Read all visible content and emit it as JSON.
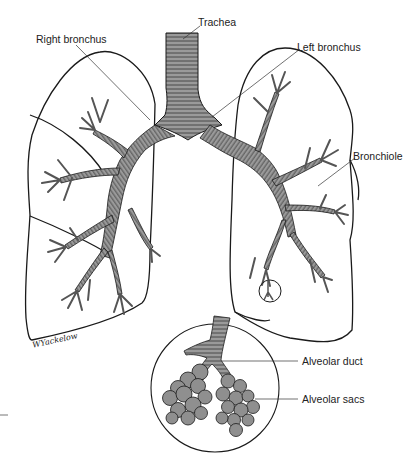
{
  "diagram": {
    "labels": {
      "trachea": "Trachea",
      "right_bronchus": "Right bronchus",
      "left_bronchus": "Left bronchus",
      "bronchiole": "Bronchiole",
      "alveolar_duct": "Alveolar duct",
      "alveolar_sacs": "Alveolar sacs"
    },
    "signature": "WYackelow",
    "colors": {
      "airway_fill": "#9a9a9a",
      "outline": "#1a1a1a",
      "background": "#ffffff",
      "alveoli_fill": "#8f8f8f"
    },
    "inset": {
      "description": "Magnified view of circled bronchiole tip",
      "shape": "circle"
    }
  }
}
